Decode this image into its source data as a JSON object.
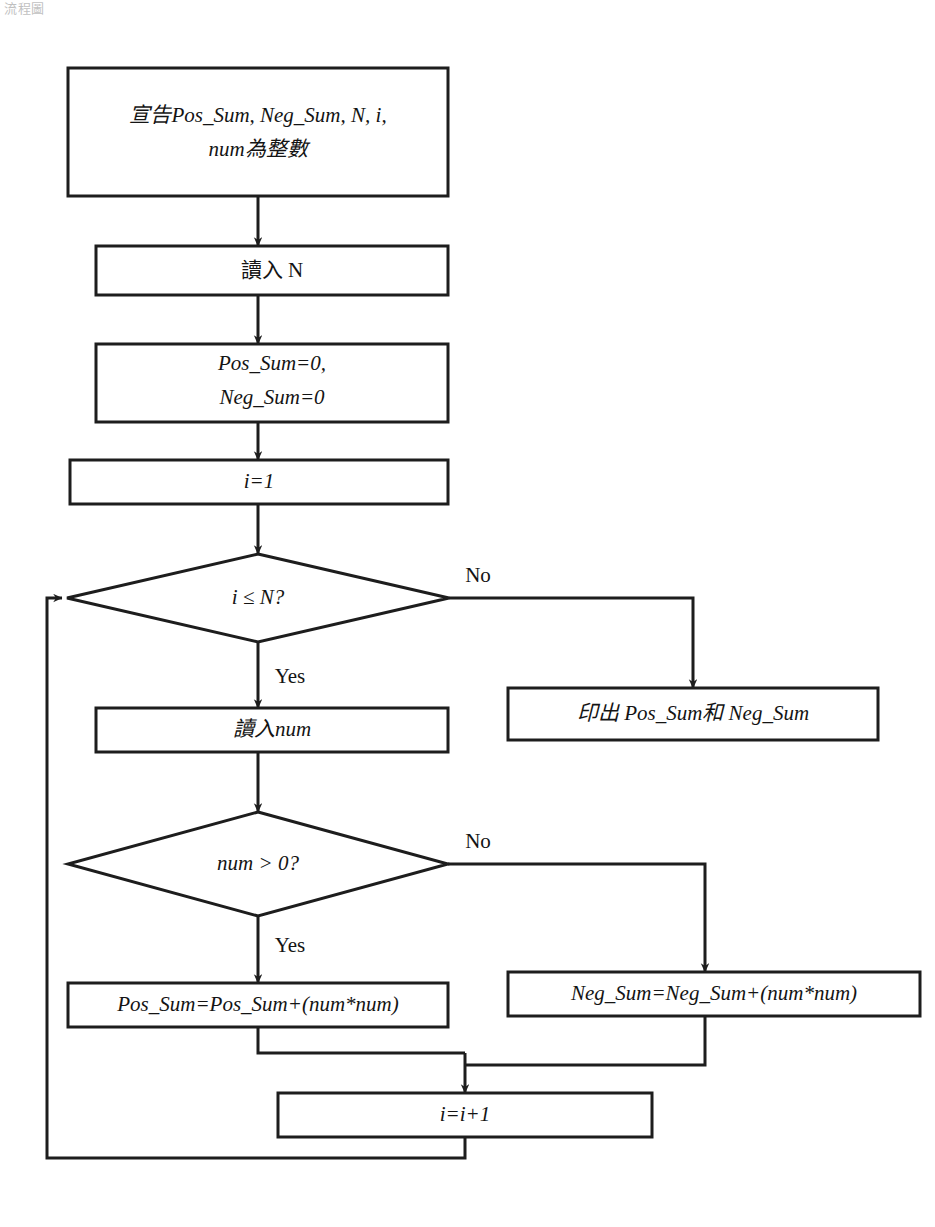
{
  "page": {
    "corner_caption": "流程圖",
    "width": 935,
    "height": 1227,
    "background": "#ffffff",
    "line_color": "#1d1d1d",
    "text_color": "#141414"
  },
  "flowchart": {
    "title": "平方和流程圖",
    "nodes": {
      "declare": {
        "shape": "process",
        "line1": "宣告Pos_Sum, Neg_Sum, N, i,",
        "line2": "num為整數"
      },
      "read_n": {
        "shape": "process",
        "label": "讀入 N"
      },
      "init_sums": {
        "shape": "process",
        "line1": "Pos_Sum=0,",
        "line2": "Neg_Sum=0"
      },
      "init_i": {
        "shape": "process",
        "label": "i=1"
      },
      "cond_loop": {
        "shape": "decision",
        "label": "i ≤ N?"
      },
      "print_result": {
        "shape": "process",
        "label": "印出 Pos_Sum和 Neg_Sum"
      },
      "read_num": {
        "shape": "process",
        "label": "讀入num"
      },
      "cond_positive": {
        "shape": "decision",
        "label": "num > 0?"
      },
      "add_pos": {
        "shape": "process",
        "label": "Pos_Sum=Pos_Sum+(num*num)"
      },
      "add_neg": {
        "shape": "process",
        "label": "Neg_Sum=Neg_Sum+(num*num)"
      },
      "increment_i": {
        "shape": "process",
        "label": "i=i+1"
      }
    },
    "branch_labels": {
      "loop_no": "No",
      "loop_yes": "Yes",
      "positive_no": "No",
      "positive_yes": "Yes"
    }
  }
}
